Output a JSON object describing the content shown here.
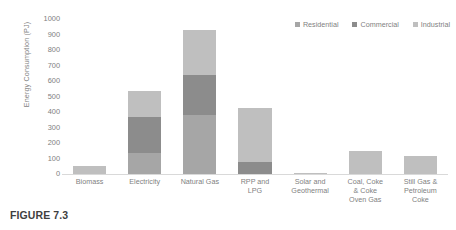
{
  "caption": "FIGURE 7.3",
  "legend": {
    "position": "top-right",
    "items": [
      {
        "label": "Residential",
        "color": "#a6a6a6"
      },
      {
        "label": "Commercial",
        "color": "#8c8c8c"
      },
      {
        "label": "Industrial",
        "color": "#bfbfbf"
      }
    ]
  },
  "axes": {
    "ylabel": "Energy Consumption (PJ)",
    "xlabel": "",
    "yticks": [
      0,
      100,
      200,
      300,
      400,
      500,
      600,
      700,
      800,
      900,
      1000
    ],
    "ytick_labels": [
      "0",
      "100",
      "200",
      "300",
      "400",
      "500",
      "600",
      "700",
      "800",
      "900",
      "1000"
    ]
  },
  "chart_data": {
    "type": "bar",
    "stacked": true,
    "title": "",
    "xlabel": "",
    "ylabel": "Energy Consumption (PJ)",
    "ylim": [
      0,
      1000
    ],
    "grid": false,
    "legend_position": "top-right",
    "categories": [
      "Biomass",
      "Electricity",
      "Natural Gas",
      "RPP and LPG",
      "Solar and Geothermal",
      "Coal, Coke & Coke Oven Gas",
      "Still Gas & Petroleum Coke"
    ],
    "category_labels": [
      [
        "Biomass"
      ],
      [
        "Electricity"
      ],
      [
        "Natural Gas"
      ],
      [
        "RPP and",
        "LPG"
      ],
      [
        "Solar and",
        "Geothermal"
      ],
      [
        "Coal, Coke",
        "& Coke",
        "Oven Gas"
      ],
      [
        "Still Gas &",
        "Petroleum",
        "Coke"
      ]
    ],
    "series": [
      {
        "name": "Residential",
        "color": "#a6a6a6",
        "values": [
          0,
          135,
          380,
          0,
          0,
          0,
          0
        ]
      },
      {
        "name": "Commercial",
        "color": "#8c8c8c",
        "values": [
          0,
          235,
          260,
          75,
          0,
          0,
          0
        ]
      },
      {
        "name": "Industrial",
        "color": "#bfbfbf",
        "values": [
          50,
          165,
          290,
          350,
          8,
          150,
          115
        ]
      }
    ],
    "totals": [
      50,
      535,
      930,
      425,
      8,
      150,
      115
    ]
  }
}
